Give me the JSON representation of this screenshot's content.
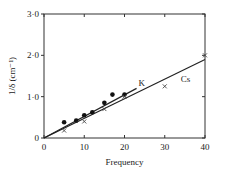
{
  "chart_data": {
    "type": "scatter",
    "title": "",
    "xlabel": "Frequency",
    "ylabel": "1/δ (cm⁻¹)",
    "xlim": [
      0,
      40
    ],
    "ylim": [
      0,
      3.0
    ],
    "x_ticks": [
      "0",
      "10",
      "20",
      "30",
      "40"
    ],
    "y_ticks": [
      "0",
      "1·0",
      "2·0",
      "3·0"
    ],
    "grid": false,
    "series": [
      {
        "name": "K",
        "marker": "filled-circle",
        "x": [
          5,
          8,
          10,
          12,
          15,
          17,
          20
        ],
        "y": [
          0.38,
          0.42,
          0.55,
          0.62,
          0.85,
          1.05,
          1.05
        ],
        "fit_line": {
          "x": [
            0,
            23
          ],
          "y": [
            0,
            1.2
          ]
        }
      },
      {
        "name": "Cs",
        "marker": "cross",
        "x": [
          5,
          10,
          15,
          20,
          30,
          40
        ],
        "y": [
          0.18,
          0.4,
          0.7,
          1.0,
          1.25,
          2.0
        ],
        "fit_line": {
          "x": [
            0,
            40
          ],
          "y": [
            0,
            1.9
          ]
        }
      }
    ],
    "annotations": [
      "K",
      "Cs"
    ]
  }
}
